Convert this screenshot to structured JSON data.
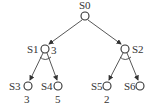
{
  "diagram": {
    "type": "and-or-tree",
    "nodes": [
      {
        "id": "S0",
        "label": "S0",
        "value": ""
      },
      {
        "id": "S1",
        "label": "S1",
        "value": "3"
      },
      {
        "id": "S2",
        "label": "S2",
        "value": ""
      },
      {
        "id": "S3",
        "label": "S3",
        "value": "3"
      },
      {
        "id": "S4",
        "label": "S4",
        "value": "5"
      },
      {
        "id": "S5",
        "label": "S5",
        "value": "2"
      },
      {
        "id": "S6",
        "label": "S6",
        "value": ""
      }
    ],
    "edges": [
      {
        "from": "S0",
        "to": "S1"
      },
      {
        "from": "S0",
        "to": "S2"
      },
      {
        "from": "S1",
        "to": "S3"
      },
      {
        "from": "S1",
        "to": "S4"
      },
      {
        "from": "S2",
        "to": "S5"
      },
      {
        "from": "S2",
        "to": "S6"
      }
    ],
    "and_nodes": [
      "S1",
      "S2"
    ]
  }
}
